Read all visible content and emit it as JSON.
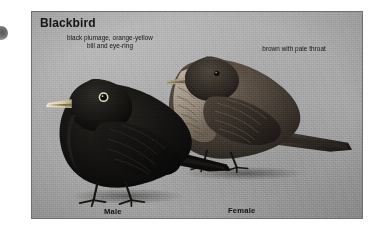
{
  "figure": {
    "title": "Blackbird",
    "annotations": [
      {
        "id": "male-description",
        "text": "black plumage, orange-yellow\nbill and eye-ring"
      },
      {
        "id": "female-description",
        "text": "brown with pale throat"
      }
    ],
    "specimen_labels": [
      {
        "id": "male",
        "text": "Male"
      },
      {
        "id": "female",
        "text": "Female"
      }
    ],
    "colors": {
      "photo_background": "#a9a9a9",
      "frame_border": "#6f6f6f",
      "text": "#141414",
      "male_plumage": "#141414",
      "male_bill": "#d8cfae",
      "female_plumage": "#4a4138",
      "page_background": "#ffffff"
    }
  }
}
